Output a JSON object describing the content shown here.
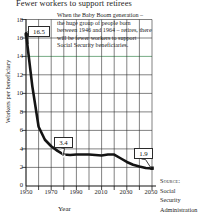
{
  "chart_data": {
    "type": "line",
    "title": "Fewer workers to support retirees",
    "xlabel": "Year",
    "ylabel": "Workers per beneficiary",
    "xlim": [
      1950,
      2050
    ],
    "ylim": [
      0,
      18
    ],
    "grid": true,
    "legend_position": "none",
    "y_ticks": [
      18,
      16,
      14,
      12,
      10,
      8,
      6,
      4,
      2,
      0
    ],
    "x_ticks": [
      1950,
      1970,
      1990,
      2010,
      2030,
      2050
    ],
    "x_minor_ticks": [
      1960,
      1980,
      2000,
      2020,
      2040
    ],
    "x": [
      1950,
      1955,
      1960,
      1965,
      1970,
      1975,
      1980,
      1985,
      1990,
      1995,
      2000,
      2005,
      2010,
      2015,
      2020,
      2025,
      2030,
      2035,
      2040,
      2045,
      2050
    ],
    "values": [
      16.5,
      10.8,
      6.4,
      5.0,
      4.3,
      3.8,
      3.4,
      3.35,
      3.4,
      3.4,
      3.4,
      3.35,
      3.3,
      3.4,
      3.4,
      3.0,
      2.6,
      2.3,
      2.1,
      1.95,
      1.9
    ],
    "data_labels": [
      {
        "label": "16.5",
        "x": 1950,
        "y": 16.5
      },
      {
        "label": "3.4",
        "x": 1990,
        "y": 3.4
      },
      {
        "label": "1.9",
        "x": 2050,
        "y": 1.9
      }
    ],
    "annotation": "When the Baby Boom generation – the huge group of people born between 1946 and 1964 – retires, there will be fewer workers to support Social Security beneficiaries.",
    "highlight_gridline": {
      "value": 14,
      "color": "#3c8a52"
    },
    "line_color": "#141414",
    "gridline_color": "#2e2e2e"
  },
  "source": {
    "label": "Source:",
    "line2": "Social",
    "line3": "Security",
    "line4": "Administration"
  }
}
